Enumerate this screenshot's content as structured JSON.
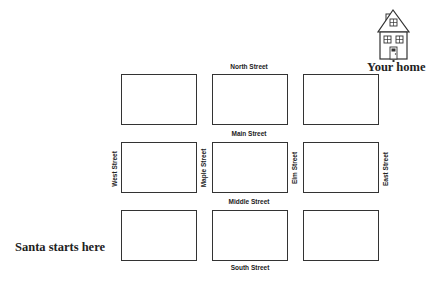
{
  "streets": {
    "north": "North Street",
    "main": "Main Street",
    "middle": "Middle Street",
    "south": "South Street",
    "west": "West Street",
    "maple": "Maple Street",
    "elm": "Elm Street",
    "east": "East Street"
  },
  "labels": {
    "home": "Your home",
    "start": "Santa starts here"
  },
  "icons": {
    "house": "house-icon"
  },
  "grid": {
    "rows": 3,
    "columns": 3,
    "border_color": "#333333"
  }
}
